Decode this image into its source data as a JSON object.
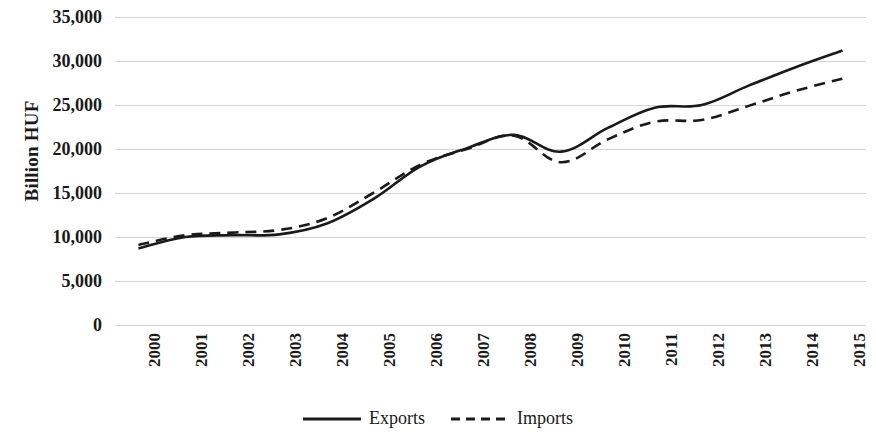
{
  "chart_data": {
    "type": "line",
    "title": "",
    "subtitle": "",
    "xlabel": "",
    "ylabel": "Billion HUF",
    "categories": [
      "2000",
      "2001",
      "2002",
      "2003",
      "2004",
      "2005",
      "2006",
      "2007",
      "2008",
      "2009",
      "2010",
      "2011",
      "2012",
      "2013",
      "2014",
      "2015"
    ],
    "series": [
      {
        "name": "Exports",
        "style": "solid",
        "color": "#1a1a1a",
        "values": [
          8700,
          10000,
          10200,
          10300,
          11500,
          14300,
          18000,
          20100,
          21600,
          19700,
          22400,
          24700,
          25000,
          27200,
          29300,
          31200
        ]
      },
      {
        "name": "Imports",
        "style": "dashed",
        "color": "#1a1a1a",
        "values": [
          9100,
          10200,
          10500,
          10800,
          12100,
          15000,
          18200,
          20000,
          21500,
          18500,
          21100,
          23100,
          23300,
          24900,
          26600,
          28000
        ]
      }
    ],
    "ylim": [
      0,
      35000
    ],
    "yticks": [
      {
        "value": 35000,
        "label": "35,000"
      },
      {
        "value": 30000,
        "label": "30,000"
      },
      {
        "value": 25000,
        "label": "25,000"
      },
      {
        "value": 20000,
        "label": "20,000"
      },
      {
        "value": 15000,
        "label": "15,000"
      },
      {
        "value": 10000,
        "label": "10,000"
      },
      {
        "value": 5000,
        "label": "5,000"
      },
      {
        "value": 0,
        "label": "0"
      }
    ],
    "grid": true,
    "grid_color": "#d5d5d5",
    "legend_position": "bottom",
    "background": "#ffffff"
  },
  "legend": {
    "items": [
      {
        "label": "Exports",
        "style": "solid"
      },
      {
        "label": "Imports",
        "style": "dashed"
      }
    ]
  }
}
